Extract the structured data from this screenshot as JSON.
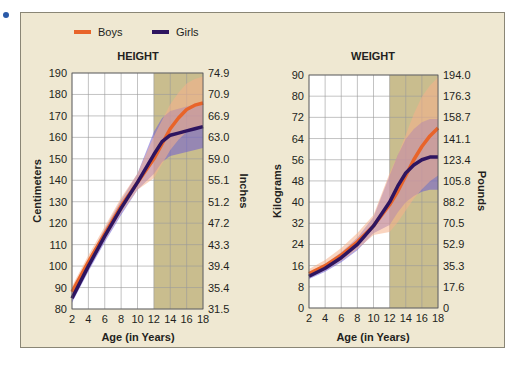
{
  "legend": [
    {
      "label": "Boys",
      "color": "#e8642a"
    },
    {
      "label": "Girls",
      "color": "#2e1560"
    }
  ],
  "chart_data": [
    {
      "type": "line",
      "title": "HEIGHT",
      "xlabel": "Age (in Years)",
      "ylabel": "Centimeters",
      "ylabel_right": "Inches",
      "x_ticks": [
        2,
        4,
        6,
        8,
        10,
        12,
        14,
        16,
        18
      ],
      "y_ticks": [
        80,
        90,
        100,
        110,
        120,
        130,
        140,
        150,
        160,
        170,
        180,
        190
      ],
      "y_ticks_right": [
        "31.5",
        "35.4",
        "39.4",
        "43.3",
        "47.2",
        "51.2",
        "55.1",
        "59.0",
        "63.0",
        "66.9",
        "70.9",
        "74.9"
      ],
      "ylim": [
        80,
        190
      ],
      "xlim": [
        2,
        18
      ],
      "shaded_region": [
        12,
        18
      ],
      "series": [
        {
          "name": "Boys",
          "x": [
            2,
            4,
            6,
            8,
            10,
            12,
            13,
            14,
            15,
            16,
            17,
            18
          ],
          "values": [
            88,
            102,
            115,
            128,
            139,
            150,
            157,
            164,
            169,
            173,
            175,
            176
          ]
        },
        {
          "name": "Girls",
          "x": [
            2,
            4,
            6,
            8,
            10,
            12,
            13,
            14,
            15,
            16,
            17,
            18
          ],
          "values": [
            85,
            100,
            114,
            127,
            139,
            152,
            158,
            161,
            162,
            163,
            164,
            165
          ]
        }
      ]
    },
    {
      "type": "line",
      "title": "WEIGHT",
      "xlabel": "Age (in Years)",
      "ylabel": "Kilograms",
      "ylabel_right": "Pounds",
      "x_ticks": [
        2,
        4,
        6,
        8,
        10,
        12,
        14,
        16,
        18
      ],
      "y_ticks": [
        0,
        8,
        16,
        24,
        32,
        40,
        48,
        56,
        64,
        72,
        80,
        90
      ],
      "y_ticks_right": [
        "0",
        "17.6",
        "35.3",
        "52.9",
        "70.5",
        "88.2",
        "105.8",
        "123.4",
        "141.1",
        "158.7",
        "176.3",
        "194.0"
      ],
      "ylim": [
        0,
        90
      ],
      "xlim": [
        2,
        18
      ],
      "shaded_region": [
        12,
        18
      ],
      "series": [
        {
          "name": "Boys",
          "x": [
            2,
            4,
            6,
            8,
            10,
            12,
            13,
            14,
            15,
            16,
            17,
            18
          ],
          "values": [
            13,
            16,
            20,
            25,
            31,
            39,
            44,
            50,
            56,
            61,
            65,
            68
          ]
        },
        {
          "name": "Girls",
          "x": [
            2,
            4,
            6,
            8,
            10,
            12,
            13,
            14,
            15,
            16,
            17,
            18
          ],
          "values": [
            12,
            15,
            19,
            24,
            31,
            40,
            46,
            51,
            54,
            56,
            57,
            57
          ]
        }
      ]
    }
  ]
}
